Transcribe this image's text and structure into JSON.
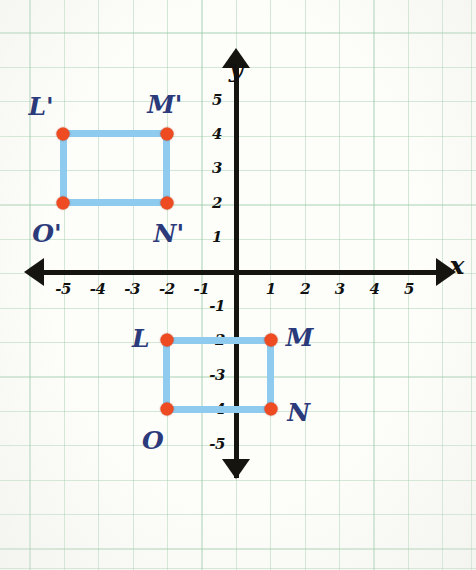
{
  "chart_data": {
    "type": "scatter",
    "title": "",
    "xlabel": "x",
    "ylabel": "y",
    "xlim": [
      -5.8,
      5.8
    ],
    "ylim": [
      -5.8,
      5.8
    ],
    "grid": true,
    "legend": "none",
    "x_ticks": [
      "-5",
      "-4",
      "-3",
      "-2",
      "-1",
      "1",
      "2",
      "3",
      "4",
      "5"
    ],
    "x_tick_values": [
      -5,
      -4,
      -3,
      -2,
      -1,
      1,
      2,
      3,
      4,
      5
    ],
    "y_ticks": [
      "5",
      "4",
      "3",
      "2",
      "1",
      "-1",
      "-2",
      "-3",
      "-4",
      "-5"
    ],
    "y_tick_values": [
      5,
      4,
      3,
      2,
      1,
      -1,
      -2,
      -3,
      -4,
      -5
    ],
    "shapes": [
      {
        "name": "image-rectangle",
        "label_suffix": "prime",
        "vertices": [
          {
            "label": "L'",
            "x": -5,
            "y": 4,
            "label_dx": -22,
            "label_dy": -28
          },
          {
            "label": "M'",
            "x": -2,
            "y": 4,
            "label_dx": -2,
            "label_dy": -30
          },
          {
            "label": "N'",
            "x": -2,
            "y": 2,
            "label_dx": 2,
            "label_dy": 30
          },
          {
            "label": "O'",
            "x": -5,
            "y": 2,
            "label_dx": -16,
            "label_dy": 30
          }
        ]
      },
      {
        "name": "preimage-rectangle",
        "label_suffix": "",
        "vertices": [
          {
            "label": "L",
            "x": -2,
            "y": -2,
            "label_dx": -26,
            "label_dy": -2
          },
          {
            "label": "M",
            "x": 1,
            "y": -2,
            "label_dx": 29,
            "label_dy": -3
          },
          {
            "label": "N",
            "x": 1,
            "y": -4,
            "label_dx": 28,
            "label_dy": 3
          },
          {
            "label": "O",
            "x": -2,
            "y": -4,
            "label_dx": -14,
            "label_dy": 31
          }
        ]
      }
    ]
  },
  "colors": {
    "grid_line": "#96c8a5",
    "axis": "#15140f",
    "segment": "#8ecbef",
    "vertex": "#ee4b22",
    "point_label": "#2b3a7a",
    "tick_label": "#111111",
    "paper": "#fdfdfa"
  },
  "axes": {
    "x_name": "x",
    "y_name": "y"
  }
}
